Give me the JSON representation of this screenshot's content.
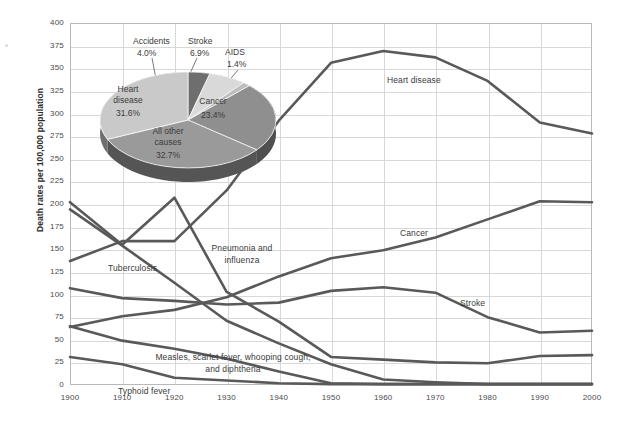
{
  "chart_data": {
    "type": "line",
    "title": "",
    "xlabel": "",
    "ylabel": "Death rates per 100,000 population",
    "xlim": [
      1900,
      2000
    ],
    "ylim": [
      0,
      400
    ],
    "ytick_step": 25,
    "grid": true,
    "legend": "inline-labels",
    "x": [
      1900,
      1910,
      1920,
      1930,
      1940,
      1950,
      1960,
      1970,
      1980,
      1990,
      2000
    ],
    "yticks": [
      "400",
      "375",
      "350",
      "325",
      "300",
      "275",
      "250",
      "225",
      "200",
      "175",
      "150",
      "125",
      "100",
      "75",
      "50",
      "25",
      "0"
    ],
    "xticks": [
      "1900",
      "1910",
      "1920",
      "1930",
      "1940",
      "1950",
      "1960",
      "1970",
      "1980",
      "1990",
      "2000"
    ],
    "series": [
      {
        "name": "Heart disease",
        "label": "Heart disease",
        "values": [
          137,
          159,
          159,
          215,
          292,
          356,
          369,
          362,
          336,
          290,
          278
        ]
      },
      {
        "name": "Cancer",
        "label": "Cancer",
        "values": [
          64,
          76,
          83,
          97,
          120,
          140,
          149,
          163,
          183,
          203,
          202
        ]
      },
      {
        "name": "Stroke",
        "label": "Stroke",
        "values": [
          107,
          96,
          93,
          89,
          91,
          104,
          108,
          102,
          75,
          58,
          60
        ]
      },
      {
        "name": "Pneumonia and influenza",
        "label": "Pneumonia and influenza",
        "values": [
          202,
          155,
          207,
          103,
          70,
          31,
          28,
          25,
          24,
          32,
          33
        ]
      },
      {
        "name": "Tuberculosis",
        "label": "Tuberculosis",
        "values": [
          194,
          154,
          113,
          71,
          46,
          23,
          6,
          3,
          1,
          1,
          1
        ]
      },
      {
        "name": "Measles, scarlet fever, whooping cough, and diphtheria",
        "label": "Measles, scarlet fever, whooping cough, and diphtheria",
        "values": [
          65,
          49,
          40,
          29,
          15,
          2,
          1,
          1,
          1,
          1,
          1
        ]
      },
      {
        "name": "Typhoid fever",
        "label": "Typhoid fever",
        "values": [
          31,
          23,
          8,
          5,
          2,
          1,
          1,
          1,
          1,
          1,
          1
        ]
      }
    ],
    "inset_pie": {
      "type": "pie",
      "title": "",
      "labels": [
        "Heart disease",
        "All other causes",
        "Cancer",
        "Stroke",
        "Accidents",
        "AIDS"
      ],
      "values": [
        31.6,
        32.7,
        23.4,
        6.9,
        4.0,
        1.4
      ],
      "value_labels": [
        "31.6%",
        "32.7%",
        "23.4%",
        "6.9%",
        "4.0%",
        "1.4%"
      ],
      "colors": [
        "#c9c9c9",
        "#9a9a9a",
        "#8f8f8f",
        "#d9d9d9",
        "#6e6e6e",
        "#bdbdbd"
      ]
    }
  },
  "axis": {
    "ylabel": "Death rates per 100,000 population"
  },
  "pie_labels": {
    "accidents_name": "Accidents",
    "accidents_pct": "4.0%",
    "stroke_name": "Stroke",
    "stroke_pct": "6.9%",
    "aids_name": "AIDS",
    "aids_pct": "1.4%",
    "heart_name": "Heart disease",
    "heart_pct": "31.6%",
    "cancer_name": "Cancer",
    "cancer_pct": "23.4%",
    "other_name": "All other causes",
    "other_pct": "32.7%"
  },
  "series_labels": {
    "heart": "Heart disease",
    "cancer": "Cancer",
    "stroke": "Stroke",
    "pneumonia": "Pneumonia and influenza",
    "tuberculosis": "Tuberculosis",
    "measles": "Measles, scarlet fever, whooping cough, and diphtheria",
    "typhoid": "Typhoid fever"
  },
  "colors": {
    "line": "#595959",
    "grid": "#d8d8d8",
    "frame": "#b9b9b9",
    "text": "#3b3b3b"
  }
}
